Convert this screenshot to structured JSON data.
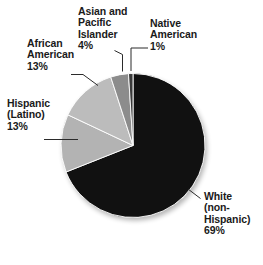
{
  "chart_data": {
    "type": "pie",
    "title": "",
    "subtitle": "",
    "xlabel": "",
    "ylabel": "",
    "legend_position": "none",
    "grid": false,
    "units": "percent",
    "start_angle_deg": 0,
    "direction": "clockwise",
    "categories": [
      "White (non-Hispanic)",
      "Hispanic (Latino)",
      "African American",
      "Asian and Pacific Islander",
      "Native American"
    ],
    "values": [
      69,
      13,
      13,
      4,
      1
    ],
    "slices": [
      {
        "name": "white-non-hispanic",
        "label_lines": [
          "White",
          "(non-",
          "Hispanic)",
          "69%"
        ],
        "value": 69,
        "value_text": "69%",
        "color": "#111111",
        "start_deg": 0,
        "end_deg": 248.4
      },
      {
        "name": "hispanic-latino",
        "label_lines": [
          "Hispanic",
          "(Latino)",
          "13%"
        ],
        "value": 13,
        "value_text": "13%",
        "color": "#b3b3b3",
        "start_deg": 248.4,
        "end_deg": 295.2
      },
      {
        "name": "african-american",
        "label_lines": [
          "African",
          "American",
          "13%"
        ],
        "value": 13,
        "value_text": "13%",
        "color": "#bcbcbc",
        "start_deg": 295.2,
        "end_deg": 342.0
      },
      {
        "name": "asian-and-pacific-islander",
        "label_lines": [
          "Asian and",
          "Pacific",
          "Islander",
          "4%"
        ],
        "value": 4,
        "value_text": "4%",
        "color": "#8c8c8c",
        "start_deg": 342.0,
        "end_deg": 356.4
      },
      {
        "name": "native-american",
        "label_lines": [
          "Native",
          "American",
          "1%"
        ],
        "value": 1,
        "value_text": "1%",
        "color": "#3a3a3a",
        "start_deg": 356.4,
        "end_deg": 360.0
      }
    ]
  },
  "labels": {
    "asian_pacific": {
      "l1": "Asian and",
      "l2": "Pacific",
      "l3": "Islander",
      "l4": "4%"
    },
    "native_american": {
      "l1": "Native",
      "l2": "American",
      "l3": "1%"
    },
    "african_american": {
      "l1": "African",
      "l2": "American",
      "l3": "13%"
    },
    "hispanic": {
      "l1": "Hispanic",
      "l2": "(Latino)",
      "l3": "13%"
    },
    "white": {
      "l1": "White",
      "l2": "(non-",
      "l3": "Hispanic)",
      "l4": "69%"
    }
  },
  "colors": {
    "background": "#ffffff",
    "text": "#1a1a1a",
    "leader_line": "#2b2b2b",
    "slice_divider": "#ffffff",
    "dark_slice": "#111111",
    "light_gray_slice": "#b3b3b3",
    "light_gray_slice_alt": "#bcbcbc",
    "mid_gray_slice": "#8c8c8c",
    "dark_gray_slice": "#3a3a3a"
  }
}
